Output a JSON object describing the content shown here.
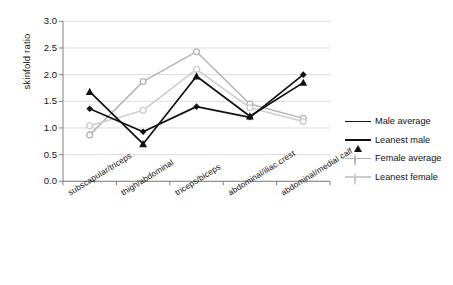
{
  "chart_data": {
    "type": "line",
    "title": "",
    "xlabel": "",
    "ylabel": "skinfold ratio",
    "categories": [
      "subscapular/triceps",
      "thigh/abdominal",
      "triceps/biceps",
      "abdominal/iliac crest",
      "abdominal/medial calf"
    ],
    "ylim": [
      0.0,
      3.0
    ],
    "yticks": [
      "0.0",
      "0.5",
      "1.0",
      "1.5",
      "2.0",
      "2.5",
      "3.0"
    ],
    "ytick_values": [
      0.0,
      0.5,
      1.0,
      1.5,
      2.0,
      2.5,
      3.0
    ],
    "grid": "horizontal",
    "legend_position": "right",
    "series": [
      {
        "name": "Male average",
        "values": [
          1.36,
          0.93,
          1.4,
          1.2,
          2.0
        ],
        "color": "#111111",
        "marker": "diamond-filled"
      },
      {
        "name": "Leanest male",
        "values": [
          1.68,
          0.7,
          1.97,
          1.22,
          1.85
        ],
        "color": "#111111",
        "marker": "triangle-filled"
      },
      {
        "name": "Female average",
        "values": [
          0.87,
          1.87,
          2.43,
          1.45,
          1.18
        ],
        "color": "#b3b3b3",
        "marker": "circle-open"
      },
      {
        "name": "Leanest female",
        "values": [
          1.04,
          1.33,
          2.1,
          1.38,
          1.12
        ],
        "color": "#cccccc",
        "marker": "circle-open"
      }
    ]
  },
  "axis": {
    "y_title": "skinfold ratio"
  },
  "colors": {
    "grid": "#d9d9d9",
    "axis": "#808080",
    "dark_series": "#111111",
    "gray_series": "#b3b3b3",
    "light_gray_series": "#cccccc"
  }
}
